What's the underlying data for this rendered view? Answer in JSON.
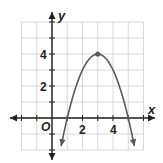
{
  "chart_data": {
    "type": "line",
    "title": "",
    "xlabel": "x",
    "ylabel": "y",
    "origin_label": "O",
    "xlim": [
      -2,
      6
    ],
    "ylim": [
      -2,
      6
    ],
    "grid": true,
    "x_tick_labels": [
      "2",
      "4"
    ],
    "y_tick_labels": [
      "2",
      "4"
    ],
    "series": [
      {
        "name": "parabola",
        "equation": "y = -(x - 3)^2 + 4",
        "x": [
          0.6,
          1,
          2,
          3,
          4,
          5,
          5.4
        ],
        "y": [
          -1.76,
          0,
          3,
          4,
          3,
          0,
          -1.76
        ],
        "arrows_at_ends": true
      }
    ],
    "points": [
      {
        "label": "vertex",
        "x": 3,
        "y": 4
      }
    ]
  },
  "colors": {
    "grid": "#d9d9d9",
    "axis": "#231f20",
    "curve": "#5a5a5a",
    "point": "#5a5a5a"
  }
}
